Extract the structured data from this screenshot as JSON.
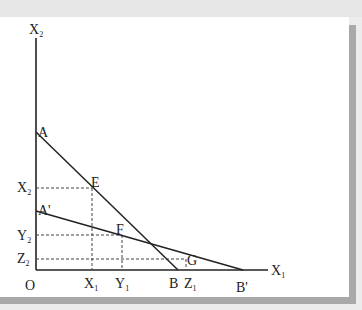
{
  "figure": {
    "axes": {
      "y_label": {
        "main": "X",
        "sub": "2"
      },
      "x_label": {
        "main": "X",
        "sub": "1"
      },
      "origin_label": "O"
    },
    "points": {
      "A": "A",
      "A_prime": "A'",
      "B": "B",
      "B_prime": "B'",
      "E": "E",
      "F": "F",
      "G": "G"
    },
    "y_ticks": [
      {
        "main": "X",
        "sub": "2"
      },
      {
        "main": "Y",
        "sub": "2"
      },
      {
        "main": "Z",
        "sub": "2"
      }
    ],
    "x_ticks": [
      {
        "main": "X",
        "sub": "1"
      },
      {
        "main": "Y",
        "sub": "1"
      },
      {
        "main": "Z",
        "sub": "1"
      }
    ],
    "lines": [
      {
        "name": "AB",
        "from": "A",
        "to": "B"
      },
      {
        "name": "A'B'",
        "from": "A'",
        "to": "B'"
      }
    ],
    "colors": {
      "line": "#222222",
      "panel": "#ffffff",
      "shadow": "#a9a9a9",
      "background": "#ececec"
    }
  }
}
